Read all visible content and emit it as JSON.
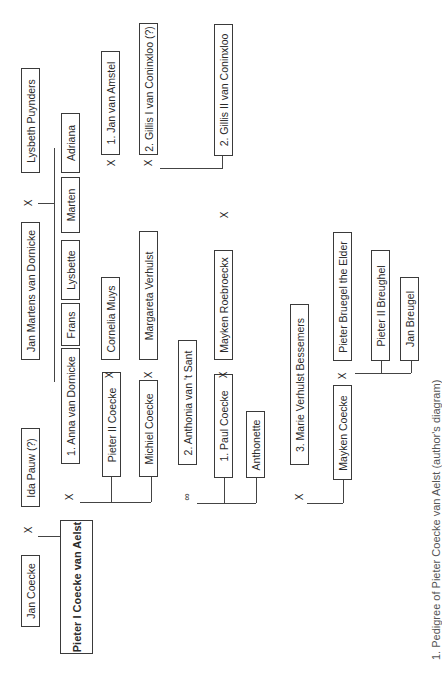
{
  "diagram": {
    "caption": "1. Pedigree of Pieter Coecke van Aelst (author's diagram)",
    "orientation": "rotated 90° counter-clockwise",
    "symbols": {
      "marriage": "X",
      "union": "∞"
    },
    "persons": {
      "lysbeth_puynders": "Lysbeth Puynders",
      "jan_martens": "Jan Martens van Dornicke",
      "ida_pauw": "Ida Pauw (?)",
      "jan_coecke": "Jan Coecke",
      "pieter_i": "Pieter I Coecke van Aelst",
      "adriana": "Adriana",
      "marten": "Marten",
      "lysbette": "Lysbette",
      "frans": "Frans",
      "anna": "1. Anna van Dornicke",
      "jan_van_amstel": "1. Jan van Amstel",
      "gillis_i": "2. Gillis I van Coninxloo (?)",
      "gillis_ii": "2. Gillis II van Coninxloo",
      "cornelia_muys": "Cornelia Muys",
      "margareta_verhulst": "Margareta Verhulst",
      "pieter_ii_coecke": "Pieter II Coecke",
      "michiel_coecke": "Michiel Coecke",
      "anthonia": "2. Anthonia van 't Sant",
      "mayken_roebroeckx": "Mayken Roebroeckx",
      "paul_coecke": "1. Paul Coecke",
      "anthonette": "Anthonette",
      "marie_verhulst": "3. Marie Verhulst Bessemers",
      "pieter_bruegel_elder": "Pieter Bruegel the Elder",
      "pieter_ii_breughel": "Pieter II Breughel",
      "jan_breugel": "Jan Breugel",
      "mayken_coecke": "Mayken Coecke"
    },
    "marks": {
      "m_jan_ida": "X",
      "m_jan_lysbeth": "X",
      "m_pieter_anna": "X",
      "m_pieter_anthonia": "∞",
      "m_pieter_marie": "X",
      "m_adriana_amstel": "X",
      "m_adriana_gillis": "X",
      "m_pieter2_cornelia": "X",
      "m_michiel_margareta": "X",
      "m_paul_mayken": "X",
      "m_anthonette": "X",
      "m_mayken_bruegel": "X"
    }
  }
}
